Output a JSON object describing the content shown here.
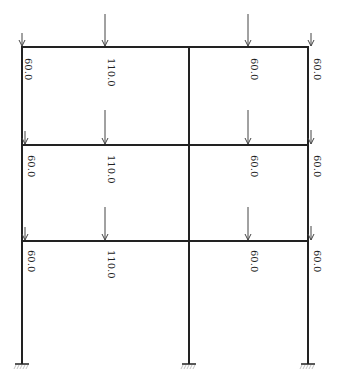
{
  "title": "",
  "diagram": {
    "type": "frame-load-diagram",
    "columns_x": [
      22,
      189,
      308
    ],
    "floors_y": [
      47,
      145,
      241
    ],
    "base_y": 364,
    "floors": [
      {
        "name": "top-floor",
        "loads": [
          {
            "value": "60.0",
            "x": 22,
            "arrow_top": 33,
            "label_y": 58
          },
          {
            "value": "110.0",
            "x": 105,
            "arrow_top": 14,
            "label_y": 58
          },
          {
            "value": "60.0",
            "x": 248,
            "arrow_top": 14,
            "label_y": 58
          },
          {
            "value": "60.0",
            "x": 311,
            "arrow_top": 33,
            "label_y": 58
          }
        ]
      },
      {
        "name": "middle-floor",
        "loads": [
          {
            "value": "60.0",
            "x": 25,
            "arrow_top": 131,
            "label_y": 155
          },
          {
            "value": "110.0",
            "x": 105,
            "arrow_top": 110,
            "label_y": 155
          },
          {
            "value": "60.0",
            "x": 248,
            "arrow_top": 110,
            "label_y": 155
          },
          {
            "value": "60.0",
            "x": 311,
            "arrow_top": 130,
            "label_y": 155
          }
        ]
      },
      {
        "name": "bottom-floor",
        "loads": [
          {
            "value": "60.0",
            "x": 25,
            "arrow_top": 227,
            "label_y": 250
          },
          {
            "value": "110.0",
            "x": 105,
            "arrow_top": 207,
            "label_y": 250
          },
          {
            "value": "60.0",
            "x": 248,
            "arrow_top": 207,
            "label_y": 250
          },
          {
            "value": "60.0",
            "x": 311,
            "arrow_top": 226,
            "label_y": 250
          }
        ]
      }
    ],
    "supports": [
      {
        "name": "left-fixed-support",
        "x": 22
      },
      {
        "name": "middle-fixed-support",
        "x": 189
      },
      {
        "name": "right-fixed-support",
        "x": 308
      }
    ]
  }
}
